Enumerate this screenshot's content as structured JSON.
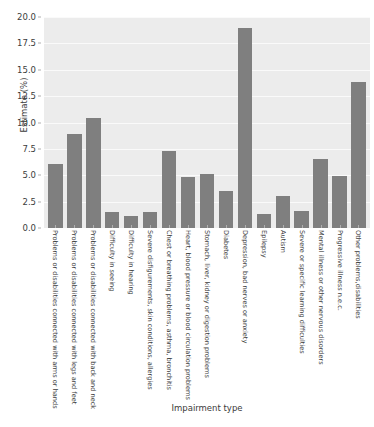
{
  "chart_data": {
    "type": "bar",
    "title": "",
    "xlabel": "Impairment type",
    "ylabel": "Estimate (%)",
    "ylim": [
      0,
      20
    ],
    "yticks": [
      "0.0",
      "2.5",
      "5.0",
      "7.5",
      "10.0",
      "12.5",
      "15.0",
      "17.5",
      "20.0"
    ],
    "ytick_values": [
      0.0,
      2.5,
      5.0,
      7.5,
      10.0,
      12.5,
      15.0,
      17.5,
      20.0
    ],
    "grid": true,
    "legend": "none",
    "bar_color": "#7f7f7f",
    "plot_background": "#ececec",
    "categories": [
      "Problems or disabilities connected with arms or hands",
      "Problems or disabilities connected with legs and feet",
      "Problems or disabilities connected with back and neck",
      "Difficulty in seeing",
      "Difficulty in hearing",
      "Severe disfigurements, skin conditions, allergies",
      "Chest or breathing problems, asthma, bronchitis",
      "Heart, blood pressure or blood circulation problems",
      "Stomach, liver, kidney or digestion problems",
      "Diabetes",
      "Depression, bad nerves or anxiety",
      "Epilepsy",
      "Autism",
      "Severe or specific learning difficulties",
      "Mental illness or other nervous disorders",
      "Progressive illness n.e.c.",
      "Other problems,disabilities"
    ],
    "values": [
      6.1,
      8.9,
      10.4,
      1.5,
      1.1,
      1.5,
      7.3,
      4.8,
      5.1,
      3.5,
      19.0,
      1.3,
      3.0,
      1.6,
      6.5,
      4.9,
      13.8
    ]
  }
}
